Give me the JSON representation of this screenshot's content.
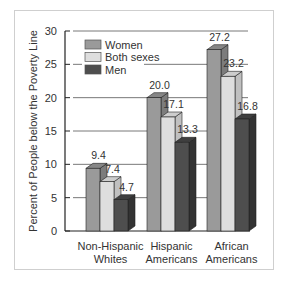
{
  "chart_data": {
    "type": "bar",
    "title": "",
    "xlabel": "",
    "ylabel": "Percent of People below the Poverty Line",
    "ylim": [
      0,
      30
    ],
    "yticks": [
      0,
      5,
      10,
      15,
      20,
      25,
      30
    ],
    "grid": true,
    "legend_position": "upper-left",
    "style": "3d-clustered",
    "categories": [
      [
        "Non-Hispanic",
        "Whites"
      ],
      [
        "Hispanic",
        "Americans"
      ],
      [
        "African",
        "Americans"
      ]
    ],
    "series": [
      {
        "name": "Women",
        "values": [
          9.4,
          20.0,
          27.2
        ],
        "labels": [
          "9.4",
          "20.0",
          "27.2"
        ],
        "color": "#9a9a9a",
        "side": "#7c7c7c",
        "top": "#868686"
      },
      {
        "name": "Both sexes",
        "values": [
          7.4,
          17.1,
          23.2
        ],
        "labels": [
          "7.4",
          "17.1",
          "23.2"
        ],
        "color": "#dedede",
        "side": "#c0c0c0",
        "top": "#cdcdcd"
      },
      {
        "name": "Men",
        "values": [
          4.7,
          13.3,
          16.8
        ],
        "labels": [
          "4.7",
          "13.3",
          "16.8"
        ],
        "color": "#4e4e4e",
        "side": "#333333",
        "top": "#3f3f3f"
      }
    ]
  }
}
